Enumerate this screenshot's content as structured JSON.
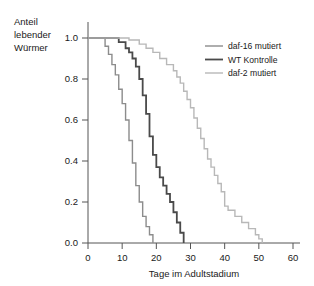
{
  "chart_data": {
    "type": "line",
    "title": "",
    "subtitle": "",
    "xlabel": "Tage im Adultstadium",
    "ylabel": "Anteil lebender Würmer",
    "ylabel_lines": [
      "Anteil",
      "lebender",
      "Würmer"
    ],
    "xlim": [
      0,
      60
    ],
    "ylim": [
      0.0,
      1.0
    ],
    "xticks": [
      0,
      10,
      20,
      30,
      40,
      50,
      60
    ],
    "xtick_labels": [
      "0",
      "10",
      "20",
      "30",
      "40",
      "50",
      "60"
    ],
    "yticks": [
      0.0,
      0.2,
      0.4,
      0.6,
      0.8,
      1.0
    ],
    "ytick_labels": [
      "0.0",
      "0.2",
      "0.4",
      "0.6",
      "0.8",
      "1.0"
    ],
    "grid": false,
    "legend_position": "top-right",
    "step_style": "post",
    "series": [
      {
        "name": "daf-16 mutiert",
        "color": "#8c8c8c",
        "line_width": 1.4,
        "x": [
          0,
          4,
          5,
          6,
          7,
          8,
          9,
          10,
          11,
          12,
          13,
          14,
          15,
          16,
          17,
          18,
          19
        ],
        "y": [
          1.0,
          1.0,
          0.96,
          0.92,
          0.87,
          0.82,
          0.75,
          0.68,
          0.6,
          0.5,
          0.39,
          0.28,
          0.2,
          0.13,
          0.08,
          0.04,
          0.0
        ]
      },
      {
        "name": "WT Kontrolle",
        "color": "#4a4a4a",
        "line_width": 1.8,
        "x": [
          0,
          7,
          9,
          11,
          12,
          13,
          14,
          15,
          16,
          17,
          18,
          19,
          20,
          21,
          22,
          23,
          24,
          25,
          26,
          27,
          28
        ],
        "y": [
          1.0,
          1.0,
          0.98,
          0.95,
          0.93,
          0.9,
          0.86,
          0.8,
          0.72,
          0.63,
          0.52,
          0.43,
          0.37,
          0.32,
          0.28,
          0.24,
          0.2,
          0.15,
          0.1,
          0.05,
          0.0
        ]
      },
      {
        "name": "daf-2 mutiert",
        "color": "#b8b8b8",
        "line_width": 1.4,
        "x": [
          0,
          9,
          12,
          15,
          17,
          19,
          21,
          23,
          25,
          26,
          27,
          28,
          29,
          30,
          31,
          32,
          33,
          34,
          35,
          36,
          37,
          38,
          39,
          40,
          41,
          43,
          45,
          47,
          49,
          50,
          51
        ],
        "y": [
          1.0,
          1.0,
          0.99,
          0.97,
          0.95,
          0.93,
          0.9,
          0.87,
          0.84,
          0.81,
          0.78,
          0.74,
          0.7,
          0.66,
          0.61,
          0.56,
          0.51,
          0.46,
          0.41,
          0.37,
          0.33,
          0.29,
          0.25,
          0.18,
          0.16,
          0.13,
          0.1,
          0.07,
          0.04,
          0.02,
          0.0
        ]
      }
    ]
  },
  "legend": {
    "entries": [
      {
        "label": "daf-16 mutiert"
      },
      {
        "label": "WT Kontrolle"
      },
      {
        "label": "daf-2 mutiert"
      }
    ]
  },
  "colors": {
    "axis": "#555555",
    "text": "#1a1a1a",
    "background": "#ffffff",
    "daf16": "#8c8c8c",
    "wt": "#4a4a4a",
    "daf2": "#b8b8b8"
  }
}
